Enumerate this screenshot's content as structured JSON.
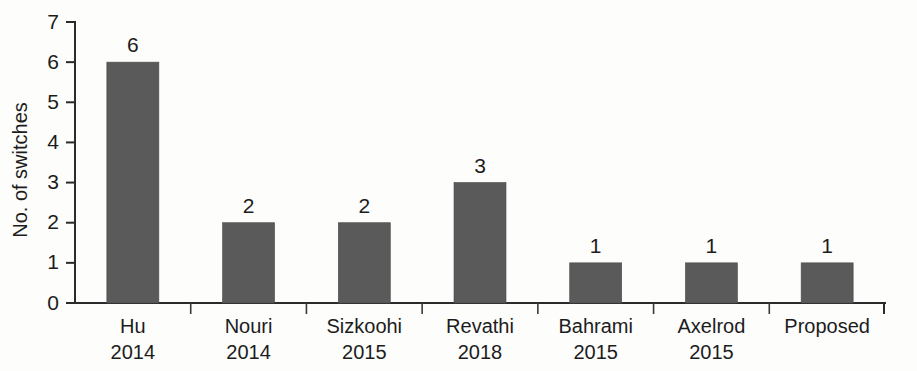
{
  "chart_data": {
    "type": "bar",
    "title": "",
    "xlabel": "",
    "ylabel": "No. of switches",
    "ylim": [
      0,
      7
    ],
    "yticks": [
      0,
      1,
      2,
      3,
      4,
      5,
      6,
      7
    ],
    "ytick_labels": [
      "0",
      "1",
      "2",
      "3",
      "4",
      "5",
      "6",
      "7"
    ],
    "grid": false,
    "legend": "none",
    "bar_color": "#5a5a5a",
    "axis_color": "#2b2b2b",
    "background_color": "#fdfdfc",
    "categories": [
      "Hu\n2014",
      "Nouri\n2014",
      "Sizkoohi\n2015",
      "Revathi\n2018",
      "Bahrami\n2015",
      "Axelrod\n2015",
      "Proposed"
    ],
    "category_names": [
      "Hu",
      "Nouri",
      "Sizkoohi",
      "Revathi",
      "Bahrami",
      "Axelrod",
      "Proposed"
    ],
    "category_years": [
      "2014",
      "2014",
      "2015",
      "2018",
      "2015",
      "2015",
      ""
    ],
    "values": [
      6,
      2,
      2,
      3,
      1,
      1,
      1
    ],
    "value_labels": [
      "6",
      "2",
      "2",
      "3",
      "1",
      "1",
      "1"
    ]
  }
}
